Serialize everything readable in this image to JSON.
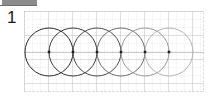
{
  "window": {
    "toolbar_sliver_color": "#8c8c8c",
    "background_color": "#ffffff"
  },
  "step_number": "1",
  "canvas": {
    "origin_x": 24,
    "origin_y": 11,
    "width": 180,
    "height": 81,
    "grid": {
      "visible": true,
      "cell_size": 8,
      "minor_color": "#dcdcdc",
      "major_color": "#c8c8c8",
      "major_every": 3,
      "border_color": "#cccccc",
      "dot_color": "#d0d0d0"
    },
    "circles": {
      "count": 6,
      "radius": 24,
      "center_y": 41,
      "center_x_values": [
        25,
        49,
        73,
        97,
        121,
        145
      ],
      "spacing": 24,
      "stroke_colors": [
        "#2b2b2b",
        "#3a3a3a",
        "#4a4a4a",
        "#6e6e6e",
        "#9a9a9a",
        "#b4b4b4"
      ],
      "stroke_width": 1,
      "fill": "none",
      "center_dot_color": "#1f1f1f",
      "center_dot_size": 2.5
    },
    "center_line": {
      "visible": true,
      "y": 41,
      "color": "#bdbdbd"
    }
  }
}
